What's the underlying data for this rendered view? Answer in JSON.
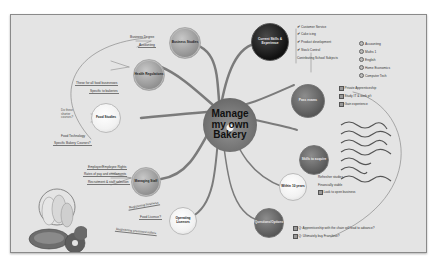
{
  "center": {
    "line1": "Manage",
    "line2": "my own",
    "line3": "Bakery"
  },
  "branches": {
    "business_studies": {
      "label": "Business Studies",
      "children": [
        "Business Degree",
        "Accounting"
      ]
    },
    "health_regulations": {
      "label": "Health Regulations",
      "children": [
        "These for all food businesses",
        "Specific to bakeries"
      ]
    },
    "food_studies": {
      "label": "Food Studies",
      "children": [
        "Food Technology",
        "Specific Bakery Courses?"
      ]
    },
    "managing_staff": {
      "label": "Managing Staff",
      "children": [
        "Employer/Employee Rights",
        "Rates of pay and entitlements",
        "Recruitment & staff selection"
      ]
    },
    "operating_licenses": {
      "label": "Operating Licenses",
      "children": [
        "Registering business",
        "Food Licence?",
        "Registering premises/outlets"
      ]
    },
    "current_skills": {
      "label": "Current Skills & Experience",
      "children": [
        {
          "label": "Customer Service",
          "icon": "check"
        },
        {
          "label": "Cake icing",
          "icon": "check"
        },
        {
          "label": "Product development",
          "icon": "check"
        },
        {
          "label": "Stock Control",
          "icon": "check"
        },
        {
          "label": "Contributing School Subjects",
          "icon": "none"
        }
      ],
      "subjects": [
        "Accounting",
        "Maths 1",
        "English",
        "Home Economics",
        "Computer Tech"
      ]
    },
    "pass_exams": {
      "label": "Pass exams",
      "children": [
        "Private Apprenticeship",
        "Study IT & work p/t",
        "Gain experience"
      ]
    },
    "skills_to_acquire": {
      "label": "Skills to acquire",
      "children": [
        "skill 1",
        "skill 2",
        "skill 3",
        "skill 4",
        "skill 5",
        "skill 6",
        "skill 7"
      ]
    },
    "within_10_years": {
      "label": "Within 10 years",
      "children": [
        "Refresher studies",
        "Financially viable",
        "Look to open business"
      ]
    },
    "questions_options": {
      "label": "Questions/Options",
      "children": [
        "Q: Apprenticeship with the chain will lead to advance?",
        "Q: Ultimately buy Franchise?"
      ]
    }
  },
  "notes": {
    "side_note": "Do these\nshorter\ncourses?"
  },
  "colors": {
    "background": "#e4e4e4",
    "frame_border": "#8a8a8a",
    "link": "#7a7a7a"
  }
}
